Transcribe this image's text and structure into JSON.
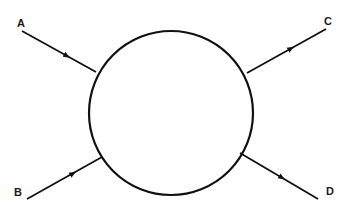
{
  "diagram": {
    "type": "scattering-vertex",
    "labels": {
      "a": "A",
      "b": "B",
      "c": "C",
      "d": "D"
    },
    "stroke_color": "#111111",
    "background": "#ffffff"
  }
}
